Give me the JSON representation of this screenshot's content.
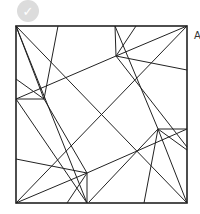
{
  "badge": {
    "icon": "check-icon",
    "glyph": "✓",
    "color": "#dcdcdc"
  },
  "label": {
    "text": "A"
  },
  "diagram": {
    "stroke": "#222222",
    "square": {
      "x": 16,
      "y": 26,
      "w": 171,
      "h": 177
    },
    "lines": [
      [
        16,
        26,
        187,
        203
      ],
      [
        187,
        26,
        16,
        203
      ],
      [
        16,
        26,
        44,
        99
      ],
      [
        16,
        26,
        87,
        203
      ],
      [
        58,
        26,
        44,
        99
      ],
      [
        115,
        26,
        116,
        56
      ],
      [
        136,
        26,
        116,
        56
      ],
      [
        115,
        26,
        158,
        129
      ],
      [
        187,
        26,
        116,
        56
      ],
      [
        116,
        56,
        187,
        70
      ],
      [
        116,
        56,
        16,
        99
      ],
      [
        116,
        56,
        187,
        147
      ],
      [
        16,
        79,
        44,
        99
      ],
      [
        16,
        99,
        44,
        99
      ],
      [
        16,
        99,
        87,
        203
      ],
      [
        44,
        99,
        87,
        173
      ],
      [
        16,
        159,
        87,
        173
      ],
      [
        87,
        173,
        87,
        203
      ],
      [
        87,
        173,
        16,
        203
      ],
      [
        87,
        173,
        187,
        129
      ],
      [
        67,
        203,
        87,
        173
      ],
      [
        89,
        202,
        158,
        129
      ],
      [
        158,
        129,
        187,
        129
      ],
      [
        158,
        129,
        144,
        203
      ],
      [
        158,
        129,
        187,
        203
      ],
      [
        158,
        129,
        187,
        150
      ]
    ]
  }
}
